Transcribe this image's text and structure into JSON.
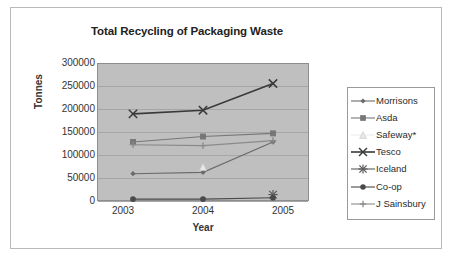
{
  "chart_data": {
    "type": "line",
    "title": "Total Recycling of Packaging Waste",
    "xlabel": "Year",
    "ylabel": "Tonnes",
    "categories": [
      "2003",
      "2004",
      "2005"
    ],
    "ylim": [
      0,
      300000
    ],
    "ytick_labels": [
      "300000",
      "250000",
      "200000",
      "150000",
      "100000",
      "50000",
      "0"
    ],
    "ytick_values": [
      300000,
      250000,
      200000,
      150000,
      100000,
      50000,
      0
    ],
    "grid": true,
    "legend_position": "right",
    "plot_background": "#bfbfbf",
    "series": [
      {
        "name": "Morrisons",
        "marker": "small-diamond",
        "color": "#6b6b6b",
        "values": [
          58000,
          61000,
          128000
        ]
      },
      {
        "name": "Asda",
        "marker": "square",
        "color": "#777777",
        "values": [
          128000,
          140000,
          147000
        ]
      },
      {
        "name": "Safeway*",
        "marker": "triangle",
        "color": "#e8e8e8",
        "values": [
          null,
          73000,
          null
        ]
      },
      {
        "name": "Tesco",
        "marker": "cross-x",
        "color": "#3a3a3a",
        "values": [
          190000,
          198000,
          257000
        ]
      },
      {
        "name": "Iceland",
        "marker": "asterisk",
        "color": "#5a5a5a",
        "values": [
          null,
          null,
          12000
        ]
      },
      {
        "name": "Co-op",
        "marker": "circle",
        "color": "#4a4a4a",
        "values": [
          2000,
          2000,
          5000
        ]
      },
      {
        "name": "J Sainsbury",
        "marker": "plus",
        "color": "#8a8a8a",
        "values": [
          122000,
          120000,
          131000
        ]
      }
    ]
  }
}
